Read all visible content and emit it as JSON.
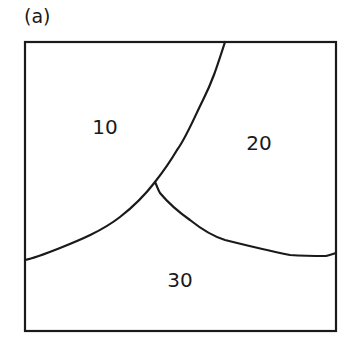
{
  "panel_label": "(a)",
  "regions": [
    {
      "label": "10",
      "x": 105,
      "y": 127
    },
    {
      "label": "20",
      "x": 259,
      "y": 143
    },
    {
      "label": "30",
      "x": 180,
      "y": 280
    }
  ],
  "colors": {
    "stroke": "#1a1a1a",
    "background": "#ffffff"
  }
}
